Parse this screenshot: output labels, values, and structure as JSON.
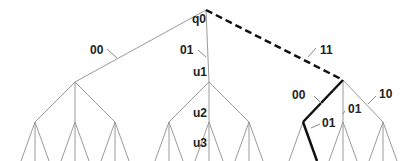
{
  "diagram": {
    "type": "tree",
    "colors": {
      "edge": "#9a9a9a",
      "highlight": "#111111",
      "label": "#222222",
      "pointer": "#888888"
    },
    "nodes": {
      "root": {
        "label": "q0",
        "x": 206,
        "y": 10
      },
      "l1": [
        {
          "x": 75,
          "y": 82
        },
        {
          "label": "u1",
          "x": 209,
          "y": 82
        },
        {
          "x": 343,
          "y": 80
        }
      ],
      "l2_y": 122,
      "leaf_y": 152,
      "path_nodes": [
        {
          "label": "u2"
        },
        {
          "label": "u3"
        }
      ]
    },
    "edge_labels": {
      "root_left": "00",
      "root_mid": "01",
      "root_right": "11",
      "right_left": "00",
      "right_mid": "01",
      "right_right": "10",
      "right_left_mid": "01"
    }
  }
}
